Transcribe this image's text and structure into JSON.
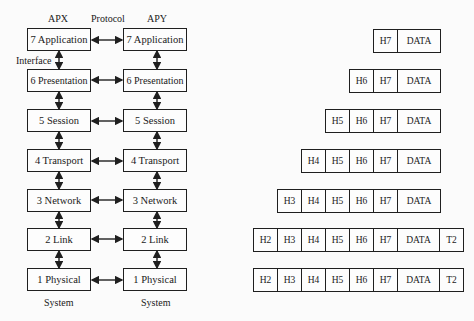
{
  "labels": {
    "left_system": "APX",
    "right_system": "APY",
    "protocol": "Protocol",
    "interface": "Interface",
    "left_footer": "System",
    "right_footer": "System"
  },
  "layers": [
    {
      "left": "7  Application",
      "right": "7  Application"
    },
    {
      "left": "6  Presentation",
      "right": "6  Presentation"
    },
    {
      "left": "5  Session",
      "right": "5  Session"
    },
    {
      "left": "4  Transport",
      "right": "4  Transport"
    },
    {
      "left": "3  Network",
      "right": "3  Network"
    },
    {
      "left": "2  Link",
      "right": "2  Link"
    },
    {
      "left": "1  Physical",
      "right": "1  Physical"
    }
  ],
  "packets": [
    [
      "H7",
      "DATA"
    ],
    [
      "H6",
      "H7",
      "DATA"
    ],
    [
      "H5",
      "H6",
      "H7",
      "DATA"
    ],
    [
      "H4",
      "H5",
      "H6",
      "H7",
      "DATA"
    ],
    [
      "H3",
      "H4",
      "H5",
      "H6",
      "H7",
      "DATA"
    ],
    [
      "H2",
      "H3",
      "H4",
      "H5",
      "H6",
      "H7",
      "DATA",
      "T2"
    ],
    [
      "H2",
      "H3",
      "H4",
      "H5",
      "H6",
      "H7",
      "DATA",
      "T2"
    ]
  ],
  "colors": {
    "line": "#1f1f1f",
    "background": "#fbfbfb"
  }
}
